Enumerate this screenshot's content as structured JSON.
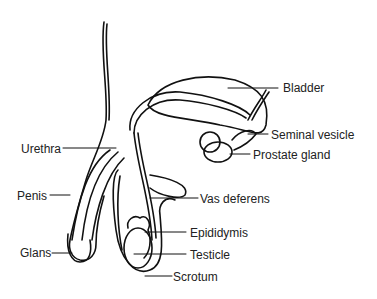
{
  "diagram": {
    "labels": {
      "bladder": "Bladder",
      "seminal_vesicle": "Seminal vesicle",
      "prostate_gland": "Prostate gland",
      "urethra": "Urethra",
      "penis": "Penis",
      "vas_deferens": "Vas deferens",
      "epididymis": "Epididymis",
      "glans": "Glans",
      "testicle": "Testicle",
      "scrotum": "Scrotum"
    }
  }
}
